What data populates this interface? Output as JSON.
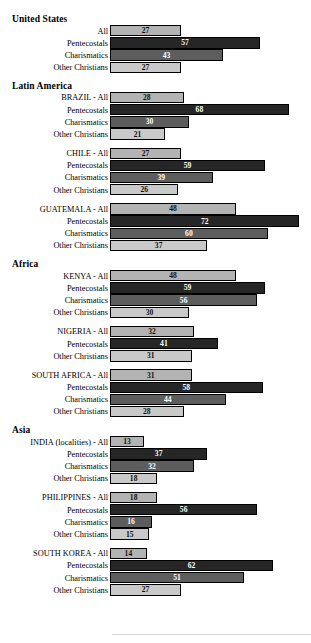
{
  "chart_data": {
    "type": "bar",
    "title": "",
    "xlabel": "",
    "ylabel": "",
    "xlim": [
      0,
      80
    ],
    "grid": false,
    "legend": "none",
    "orientation": "horizontal",
    "series_names": [
      "All",
      "Pentecostals",
      "Charismatics",
      "Other Christians"
    ],
    "series_colors": {
      "All": "#b3b3b3",
      "Pentecostals": "#262626",
      "Charismatics": "#5d5d5d",
      "Other Christians": "#c9c9c9"
    },
    "regions": [
      {
        "heading": "United States",
        "groups": [
          {
            "rows": [
              {
                "label": "All",
                "value": 27,
                "series": "All"
              },
              {
                "label": "Pentecostals",
                "value": 57,
                "series": "Pentecostals"
              },
              {
                "label": "Charismatics",
                "value": 43,
                "series": "Charismatics"
              },
              {
                "label": "Other Christians",
                "value": 27,
                "series": "Other Christians"
              }
            ]
          }
        ]
      },
      {
        "heading": "Latin America",
        "groups": [
          {
            "rows": [
              {
                "label": "BRAZIL - All",
                "value": 28,
                "series": "All"
              },
              {
                "label": "Pentecostals",
                "value": 68,
                "series": "Pentecostals"
              },
              {
                "label": "Charismatics",
                "value": 30,
                "series": "Charismatics"
              },
              {
                "label": "Other Christians",
                "value": 21,
                "series": "Other Christians"
              }
            ]
          },
          {
            "rows": [
              {
                "label": "CHILE - All",
                "value": 27,
                "series": "All"
              },
              {
                "label": "Pentecostals",
                "value": 59,
                "series": "Pentecostals"
              },
              {
                "label": "Charismatics",
                "value": 39,
                "series": "Charismatics"
              },
              {
                "label": "Other Christians",
                "value": 26,
                "series": "Other Christians"
              }
            ]
          },
          {
            "rows": [
              {
                "label": "GUATEMALA - All",
                "value": 48,
                "series": "All"
              },
              {
                "label": "Pentecostals",
                "value": 72,
                "series": "Pentecostals"
              },
              {
                "label": "Charismatics",
                "value": 60,
                "series": "Charismatics"
              },
              {
                "label": "Other Christians",
                "value": 37,
                "series": "Other Christians"
              }
            ]
          }
        ]
      },
      {
        "heading": "Africa",
        "groups": [
          {
            "rows": [
              {
                "label": "KENYA - All",
                "value": 48,
                "series": "All"
              },
              {
                "label": "Pentecostals",
                "value": 59,
                "series": "Pentecostals"
              },
              {
                "label": "Charismatics",
                "value": 56,
                "series": "Charismatics"
              },
              {
                "label": "Other Christians",
                "value": 30,
                "series": "Other Christians"
              }
            ]
          },
          {
            "rows": [
              {
                "label": "NIGERIA - All",
                "value": 32,
                "series": "All"
              },
              {
                "label": "Pentecostals",
                "value": 41,
                "series": "Pentecostals"
              },
              {
                "label": "Other Christians",
                "value": 31,
                "series": "Other Christians"
              }
            ]
          },
          {
            "rows": [
              {
                "label": "SOUTH AFRICA - All",
                "value": 31,
                "series": "All"
              },
              {
                "label": "Pentecostals",
                "value": 58,
                "series": "Pentecostals"
              },
              {
                "label": "Charismatics",
                "value": 44,
                "series": "Charismatics"
              },
              {
                "label": "Other Christians",
                "value": 28,
                "series": "Other Christians"
              }
            ]
          }
        ]
      },
      {
        "heading": "Asia",
        "groups": [
          {
            "rows": [
              {
                "label": "INDIA (localities) - All",
                "value": 13,
                "series": "All"
              },
              {
                "label": "Pentecostals",
                "value": 37,
                "series": "Pentecostals"
              },
              {
                "label": "Charismatics",
                "value": 32,
                "series": "Charismatics"
              },
              {
                "label": "Other Christians",
                "value": 18,
                "series": "Other Christians"
              }
            ]
          },
          {
            "rows": [
              {
                "label": "PHILIPPINES - All",
                "value": 18,
                "series": "All"
              },
              {
                "label": "Pentecostals",
                "value": 56,
                "series": "Pentecostals"
              },
              {
                "label": "Charismatics",
                "value": 16,
                "series": "Charismatics"
              },
              {
                "label": "Other Christians",
                "value": 15,
                "series": "Other Christians"
              }
            ]
          },
          {
            "rows": [
              {
                "label": "SOUTH KOREA - All",
                "value": 14,
                "series": "All"
              },
              {
                "label": "Pentecostals",
                "value": 62,
                "series": "Pentecostals"
              },
              {
                "label": "Charismatics",
                "value": 51,
                "series": "Charismatics"
              },
              {
                "label": "Other Christians",
                "value": 27,
                "series": "Other Christians"
              }
            ]
          }
        ]
      }
    ]
  }
}
